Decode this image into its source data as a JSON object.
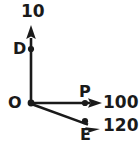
{
  "diagram": {
    "type": "vector-force-diagram",
    "background_color": "#ffffff",
    "stroke_color": "#1a1a1a",
    "origin_label": "O",
    "labels": {
      "top_value": "10",
      "point_d": "D",
      "origin": "O",
      "point_p": "P",
      "right_value": "100",
      "point_e": "E",
      "diag_value": "120"
    },
    "vectors": [
      {
        "name": "vertical-vector",
        "label": "10",
        "point_label": "D",
        "direction": "up",
        "magnitude": 10,
        "from": [
          31,
          103
        ],
        "to": [
          31,
          26
        ],
        "point_at": [
          31,
          49
        ]
      },
      {
        "name": "horizontal-vector",
        "label": "100",
        "point_label": "P",
        "direction": "right",
        "magnitude": 100,
        "from": [
          31,
          103
        ],
        "to": [
          101,
          103
        ],
        "point_at": [
          85,
          103
        ]
      },
      {
        "name": "diagonal-vector",
        "label": "120",
        "point_label": "E",
        "direction": "down-right",
        "magnitude": 120,
        "from": [
          31,
          103
        ],
        "to": [
          99,
          128
        ],
        "point_at": [
          85,
          121
        ]
      }
    ]
  }
}
